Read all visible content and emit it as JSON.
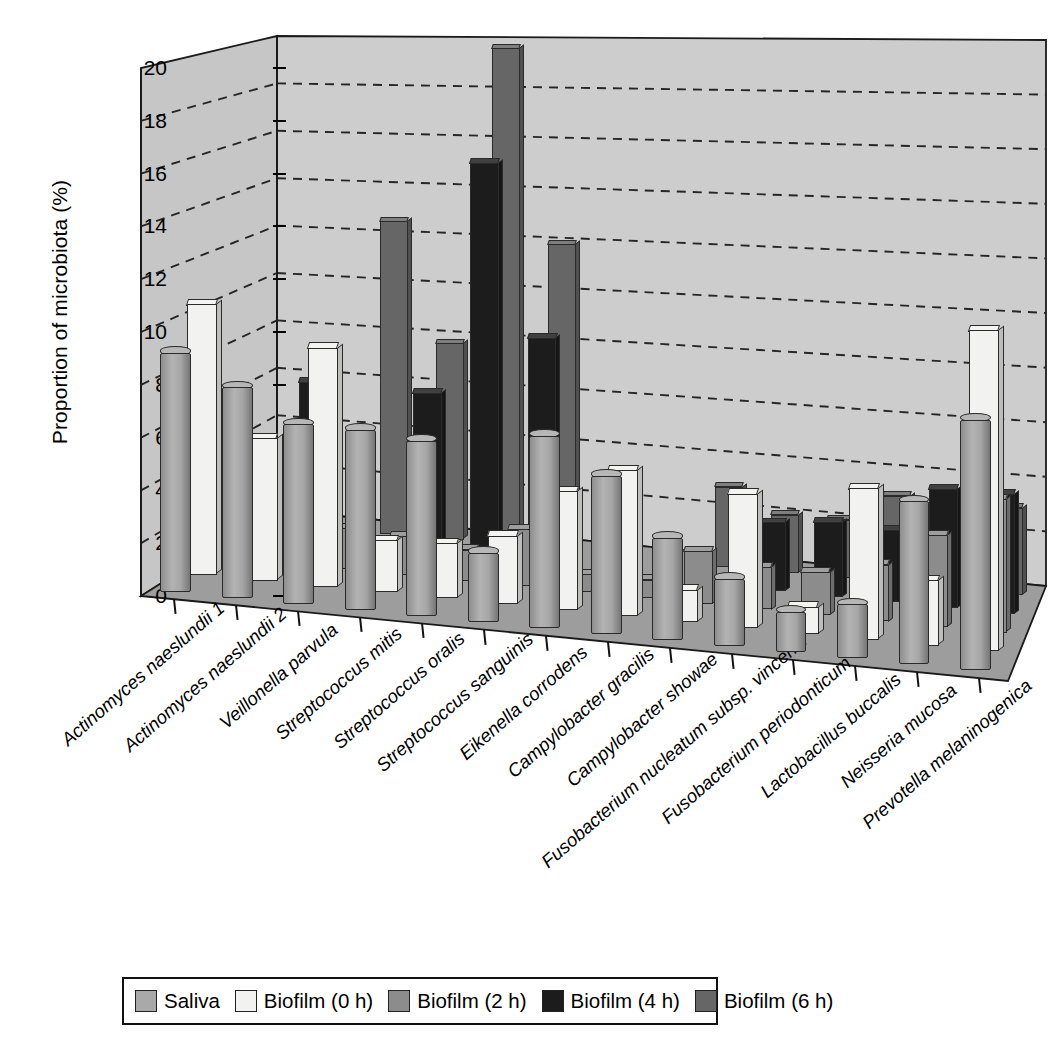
{
  "chart_data": {
    "type": "bar",
    "title": "",
    "subtitle": "",
    "xlabel": "",
    "ylabel": "Proportion of microbiota (%)",
    "ylim": [
      0,
      20
    ],
    "yticks": [
      0,
      2,
      4,
      6,
      8,
      10,
      12,
      14,
      16,
      18,
      20
    ],
    "grid": "horizontal-dashed",
    "legend_position": "bottom",
    "projection": "3d-perspective",
    "categories": [
      "Actinomyces naeslundii 1",
      "Actinomyces naeslundii 2",
      "Veillonella parvula",
      "Streptococcus mitis",
      "Streptococcus oralis",
      "Streptococcus sanguinis",
      "Eikenella corrodens",
      "Campylobacter gracilis",
      "Campylobacter showae",
      "Fusobacterium nucleatum subsp. vincentii",
      "Fusobacterium periodonticum",
      "Lactobacillus buccalis",
      "Neisseria mucosa",
      "Prevotella melaninogenica"
    ],
    "series": [
      {
        "name": "Saliva",
        "color": "#a9a9a9",
        "shape": "cylinder",
        "values": [
          9.1,
          8.0,
          6.8,
          6.8,
          6.6,
          2.6,
          7.2,
          5.9,
          3.8,
          2.5,
          1.5,
          2.0,
          6.0,
          9.2
        ]
      },
      {
        "name": "Biofilm (0 h)",
        "color": "#f2f2f0",
        "shape": "bar",
        "values": [
          10.5,
          5.5,
          9.2,
          2.0,
          2.1,
          2.6,
          4.5,
          5.5,
          1.2,
          5.0,
          1.0,
          5.6,
          2.4,
          11.8
        ]
      },
      {
        "name": "Biofilm (2 h)",
        "color": "#8c8c8c",
        "shape": "bar",
        "values": [
          0.8,
          2.0,
          1.6,
          1.5,
          1.2,
          2.2,
          0.7,
          0.7,
          2.0,
          1.6,
          1.6,
          2.1,
          3.4,
          4.9
        ]
      },
      {
        "name": "Biofilm (4 h)",
        "color": "#1c1c1c",
        "shape": "bar",
        "values": [
          0.0,
          6.6,
          0.0,
          6.5,
          15.7,
          9.0,
          0.0,
          0.0,
          0.0,
          2.6,
          2.8,
          2.7,
          4.4,
          4.4
        ]
      },
      {
        "name": "Biofilm (6 h)",
        "color": "#666666",
        "shape": "bar",
        "values": [
          0.0,
          0.0,
          12.7,
          7.9,
          19.8,
          12.1,
          0.0,
          0.0,
          3.1,
          2.2,
          2.2,
          3.3,
          3.6,
          3.2
        ]
      }
    ]
  },
  "legend": {
    "items": [
      {
        "label": "Saliva",
        "color": "#a9a9a9"
      },
      {
        "label": "Biofilm (0 h)",
        "color": "#f2f2f0"
      },
      {
        "label": "Biofilm (2 h)",
        "color": "#8c8c8c"
      },
      {
        "label": "Biofilm (4 h)",
        "color": "#1c1c1c"
      },
      {
        "label": "Biofilm (6 h)",
        "color": "#666666"
      }
    ]
  },
  "axes": {
    "y_title": "Proportion of microbiota (%)",
    "y_tick_labels": [
      "0",
      "2",
      "4",
      "6",
      "8",
      "10",
      "12",
      "14",
      "16",
      "18",
      "20"
    ]
  },
  "colors": {
    "wall_back": "#cdcdcd",
    "wall_side": "#c6c6c6",
    "floor": "#9d9d9d",
    "outline": "#1a1a1a",
    "gridline": "#262626"
  }
}
